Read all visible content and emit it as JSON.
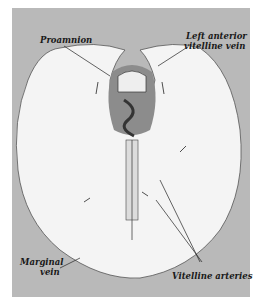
{
  "figure": {
    "labels": {
      "proamnion": "Proamnion",
      "left_anterior_vitelline_vein_line1": "Left anterior",
      "left_anterior_vitelline_vein_line2": "vitelline vein",
      "marginal_vein_line1": "Marginal",
      "marginal_vein_line2": "vein",
      "vitelline_arteries": "Vitelline arteries"
    },
    "colors": {
      "background_panel": "#b9b9b9",
      "area_vasculosa": "#f4f4f4",
      "proamnion": "#8c8c8c",
      "ink": "#1a1a1a"
    }
  }
}
